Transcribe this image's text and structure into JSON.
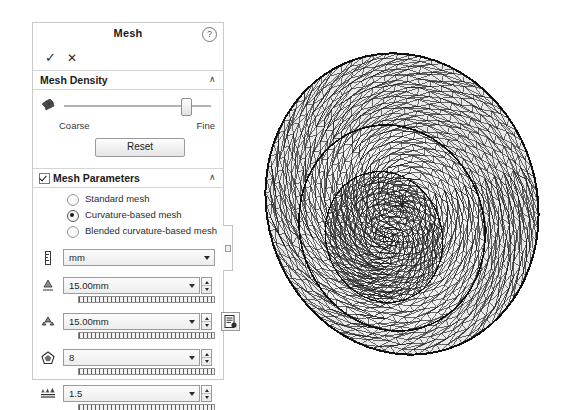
{
  "panel": {
    "title": "Mesh",
    "help_icon": "help-circle-icon",
    "accept_label": "✓",
    "cancel_label": "✕",
    "accent_color": "#1b1b1b",
    "sections": {
      "density": {
        "title": "Mesh Density",
        "collapse_chevron": "∧",
        "icon": "mesh-density-icon",
        "slider": {
          "value_percent": 82,
          "min_label": "Coarse",
          "max_label": "Fine"
        },
        "reset_label": "Reset"
      },
      "parameters": {
        "title": "Mesh Parameters",
        "checked": true,
        "collapse_chevron": "∧",
        "mesh_type_options": [
          {
            "label": "Standard mesh",
            "selected": false
          },
          {
            "label": "Curvature-based mesh",
            "selected": true
          },
          {
            "label": "Blended curvature-based mesh",
            "selected": false
          }
        ],
        "fields": [
          {
            "name": "units",
            "icon": "ruler-icon",
            "value": "mm",
            "spinner": false,
            "tickstrip": false
          },
          {
            "name": "max-element-size",
            "icon": "max-element-icon",
            "value": "15.00mm",
            "spinner": true,
            "tickstrip": true
          },
          {
            "name": "min-element-size",
            "icon": "min-element-icon",
            "value": "15.00mm",
            "spinner": true,
            "tickstrip": true
          },
          {
            "name": "circle-element-count",
            "icon": "pentagon-icon",
            "value": "8",
            "spinner": true,
            "tickstrip": true
          },
          {
            "name": "element-growth-ratio",
            "icon": "growth-ratio-icon",
            "value": "1.5",
            "spinner": true,
            "tickstrip": true
          }
        ],
        "options_button_icon": "mesh-options-icon"
      }
    },
    "edge_tab_icon": "panel-edge-tab-icon"
  },
  "viewport": {
    "model_name": "meshed-dome-model",
    "mesh_line_color": "#111111",
    "mesh_fill_color": "#e8e8e8"
  }
}
